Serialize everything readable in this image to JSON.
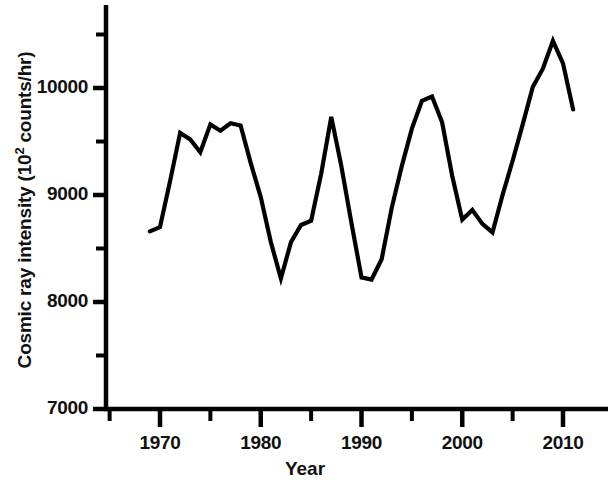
{
  "chart_data": {
    "type": "line",
    "title": "",
    "xlabel": "Year",
    "ylabel": "Cosmic ray intensity (10^2 counts/hr)",
    "ylabel_prefix": "Cosmic ray intensity (10",
    "ylabel_exponent": "2",
    "ylabel_suffix": " counts/hr)",
    "xlim": [
      1964.6,
      2015.5
    ],
    "ylim": [
      7000,
      10800
    ],
    "grid": false,
    "legend": null,
    "xticks": [
      1970,
      1980,
      1990,
      2000,
      2010
    ],
    "xtick_labels": [
      "1970",
      "1980",
      "1990",
      "2000",
      "2010"
    ],
    "xminorticks": [
      1965,
      1975,
      1985,
      1995,
      2005,
      2015
    ],
    "yticks": [
      7000,
      8000,
      9000,
      10000
    ],
    "ytick_labels": [
      "7000",
      "8000",
      "9000",
      "10000"
    ],
    "yminorticks": [
      7500,
      8500,
      9500,
      10500
    ],
    "line_color": "#000000",
    "line_width": 4.2,
    "x": [
      1969,
      1970,
      1971,
      1972,
      1973,
      1974,
      1975,
      1976,
      1977,
      1978,
      1979,
      1980,
      1981,
      1982,
      1983,
      1984,
      1985,
      1986,
      1987,
      1988,
      1989,
      1990,
      1991,
      1992,
      1993,
      1994,
      1995,
      1996,
      1997,
      1998,
      1999,
      2000,
      2001,
      2002,
      2003,
      2004,
      2005,
      2006,
      2007,
      2008,
      2009,
      2010,
      2011
    ],
    "y": [
      8660,
      8700,
      9130,
      9580,
      9520,
      9400,
      9660,
      9600,
      9670,
      9650,
      9300,
      8980,
      8560,
      8220,
      8560,
      8720,
      8760,
      9200,
      9730,
      9270,
      8740,
      8230,
      8210,
      8400,
      8880,
      9270,
      9620,
      9880,
      9920,
      9680,
      9180,
      8770,
      8860,
      8730,
      8650,
      9000,
      9320,
      9660,
      10010,
      10180,
      10440,
      10230,
      9800
    ],
    "series": [
      {
        "name": "Cosmic ray intensity",
        "values": [
          8660,
          8700,
          9130,
          9580,
          9520,
          9400,
          9660,
          9600,
          9670,
          9650,
          9300,
          8980,
          8560,
          8220,
          8560,
          8720,
          8760,
          9200,
          9730,
          9270,
          8740,
          8230,
          8210,
          8400,
          8880,
          9270,
          9620,
          9880,
          9920,
          9680,
          9180,
          8770,
          8860,
          8730,
          8650,
          9000,
          9320,
          9660,
          10010,
          10180,
          10440,
          10230,
          9800
        ]
      }
    ]
  },
  "axis": {
    "x_title": "Year"
  }
}
